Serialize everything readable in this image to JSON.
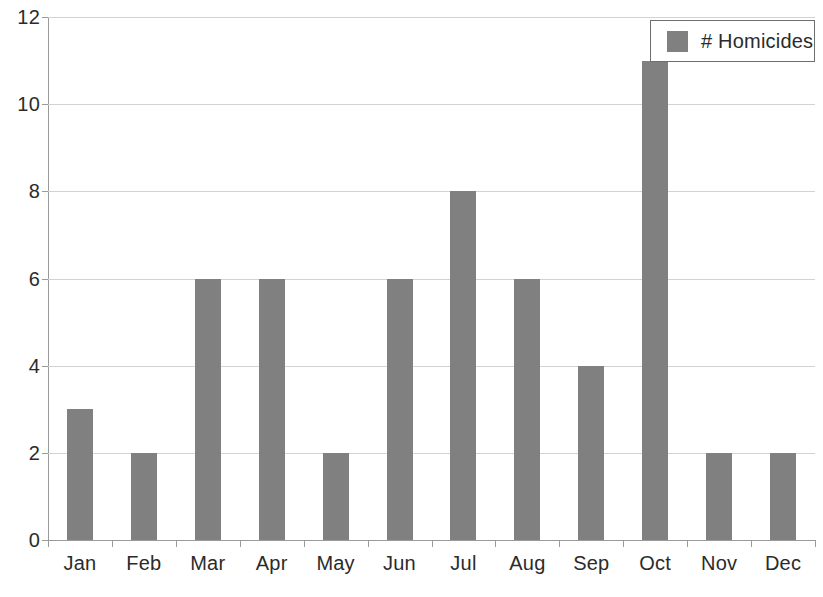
{
  "chart_data": {
    "type": "bar",
    "title": "",
    "subtitle": "",
    "xlabel": "",
    "ylabel": "",
    "categories": [
      "Jan",
      "Feb",
      "Mar",
      "Apr",
      "May",
      "Jun",
      "Jul",
      "Aug",
      "Sep",
      "Oct",
      "Nov",
      "Dec"
    ],
    "series": [
      {
        "name": "# Homicides",
        "color": "#808080",
        "values": [
          3,
          2,
          6,
          6,
          2,
          6,
          8,
          6,
          4,
          11,
          2,
          2
        ]
      }
    ],
    "values": [
      3,
      2,
      6,
      6,
      2,
      6,
      8,
      6,
      4,
      11,
      2,
      2
    ],
    "ylim": [
      0,
      12
    ],
    "y_ticks": [
      0,
      2,
      4,
      6,
      8,
      10,
      12
    ],
    "y_tick_labels": [
      "0",
      "2",
      "4",
      "6",
      "8",
      "10",
      "12"
    ],
    "grid": true,
    "grid_axis": "y",
    "legend_position": "top-right",
    "legend_entries": [
      "# Homicides"
    ]
  },
  "legend": {
    "label": "# Homicides",
    "swatch_color": "#808080",
    "border_color": "#6e6e6e"
  },
  "axes": {
    "axis_color": "#9a9a9a",
    "grid_color": "#d2d2d2",
    "tick_text_color": "#2b2b2b"
  }
}
